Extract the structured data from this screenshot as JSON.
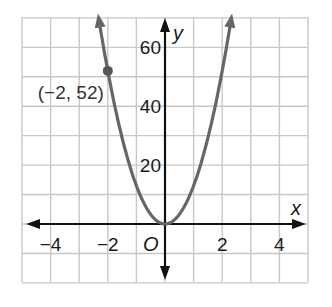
{
  "chart_data": {
    "type": "line",
    "title": "",
    "xlabel": "x",
    "ylabel": "y",
    "origin_label": "O",
    "xlim": [
      -5,
      5
    ],
    "ylim": [
      -20,
      70
    ],
    "grid": true,
    "x_grid_step": 1,
    "y_grid_step": 10,
    "x_ticks": [
      -4,
      -2,
      2,
      4
    ],
    "x_tick_labels": [
      "−4",
      "−2",
      "2",
      "4"
    ],
    "y_ticks": [
      20,
      40,
      60
    ],
    "y_tick_labels": [
      "20",
      "40",
      "60"
    ],
    "series": [
      {
        "name": "y = 13x^2",
        "function": "13*x^2",
        "x": [
          -2.3,
          -2,
          -1.5,
          -1,
          -0.5,
          0,
          0.5,
          1,
          1.5,
          2,
          2.3
        ],
        "y": [
          68.8,
          52,
          29.3,
          13,
          3.3,
          0,
          3.3,
          13,
          29.3,
          52,
          68.8
        ],
        "color": "#666666",
        "arrows_at_ends": true
      }
    ],
    "annotations": [
      {
        "text": "(−2, 52)",
        "point": [
          -2,
          52
        ],
        "marker": "dot"
      }
    ]
  },
  "colors": {
    "grid": "#c8c8c8",
    "axes": "#111111",
    "curve": "#666666",
    "point": "#555555"
  }
}
